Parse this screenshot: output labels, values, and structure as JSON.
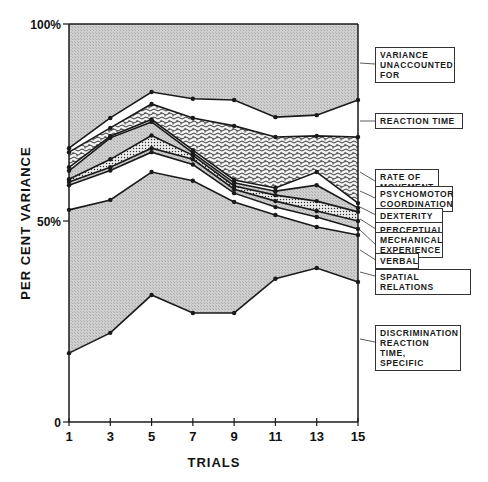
{
  "chart_data": {
    "type": "area",
    "stacked": true,
    "title": "",
    "xlabel": "TRIALS",
    "ylabel": "PER CENT VARIANCE",
    "x": [
      1,
      3,
      5,
      7,
      9,
      11,
      13,
      15
    ],
    "x_ticks": [
      "1",
      "3",
      "5",
      "7",
      "9",
      "11",
      "13",
      "15"
    ],
    "y_ticks": [
      "0",
      "50%",
      "100%"
    ],
    "ylim": [
      0,
      100
    ],
    "grid": false,
    "legend_position": "right",
    "boundaries_note": "cumulative upper boundary (%) of each factor band, bottom to top",
    "series": [
      {
        "name": "DISCRIMINATION REACTION TIME, SPECIFIC",
        "upper": [
          17.3,
          22.4,
          31.9,
          27.4,
          27.4,
          36.0,
          38.7,
          35.2
        ],
        "fill": "white"
      },
      {
        "name": "SPATIAL RELATIONS",
        "upper": [
          53.3,
          55.8,
          62.8,
          60.6,
          55.3,
          52.0,
          49.0,
          47.0
        ],
        "fill": "gray"
      },
      {
        "name": "VERBAL",
        "upper": [
          59.5,
          63.2,
          67.8,
          64.7,
          57.5,
          54.0,
          51.5,
          48.5
        ],
        "fill": "white"
      },
      {
        "name": "MECHANICAL EXPERIENCE",
        "upper": [
          60.3,
          64.0,
          68.8,
          66.0,
          58.5,
          55.5,
          53.0,
          50.5
        ],
        "fill": "gray"
      },
      {
        "name": "PERCEPTUAL",
        "upper": [
          61.0,
          66.0,
          72.0,
          67.0,
          59.3,
          57.0,
          55.5,
          52.8
        ],
        "fill": "dots"
      },
      {
        "name": "DEXTERITY",
        "upper": [
          63.1,
          71.4,
          75.4,
          67.6,
          60.1,
          58.0,
          59.5,
          53.8
        ],
        "fill": "gray"
      },
      {
        "name": "PSYCHOMOTOR COORDINATION",
        "upper": [
          64.0,
          71.8,
          76.0,
          68.3,
          60.8,
          58.8,
          62.8,
          55.0
        ],
        "fill": "white"
      },
      {
        "name": "RATE OF MOVEMENT",
        "upper": [
          67.8,
          73.9,
          79.9,
          76.4,
          74.4,
          71.6,
          71.9,
          71.6
        ],
        "fill": "squiggle"
      },
      {
        "name": "REACTION TIME",
        "upper": [
          68.8,
          76.4,
          82.9,
          81.2,
          80.9,
          76.6,
          77.1,
          80.9
        ],
        "fill": "white"
      },
      {
        "name": "VARIANCE UNACCOUNTED FOR",
        "upper": [
          100,
          100,
          100,
          100,
          100,
          100,
          100,
          100
        ],
        "fill": "gray"
      }
    ]
  },
  "axis": {
    "y_label": "PER CENT VARIANCE",
    "x_label": "TRIALS",
    "y_tick_100": "100%",
    "y_tick_50": "50%",
    "y_tick_0": "0",
    "x_ticks": [
      "1",
      "3",
      "5",
      "7",
      "9",
      "11",
      "13",
      "15"
    ]
  },
  "legend": [
    {
      "lines": [
        "VARIANCE",
        "UNACCOUNTED",
        "FOR"
      ]
    },
    {
      "lines": [
        "REACTION TIME"
      ]
    },
    {
      "lines": [
        "RATE OF",
        "MOVEMENT"
      ]
    },
    {
      "lines": [
        "PSYCHOMOTOR",
        "COORDINATION"
      ]
    },
    {
      "lines": [
        "DEXTERITY"
      ]
    },
    {
      "lines": [
        "PERCEPTUAL"
      ]
    },
    {
      "lines": [
        "MECHANICAL",
        "EXPERIENCE"
      ]
    },
    {
      "lines": [
        "VERBAL"
      ]
    },
    {
      "lines": [
        "SPATIAL RELATIONS"
      ]
    },
    {
      "lines": [
        "DISCRIMINATION",
        "REACTION TIME,",
        "SPECIFIC"
      ]
    }
  ],
  "colors": {
    "gray_fill": "#c9c9c9",
    "line": "#1a1a1a",
    "background": "#ffffff"
  }
}
